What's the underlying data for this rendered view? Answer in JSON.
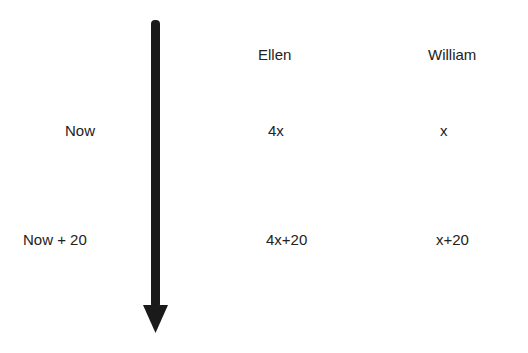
{
  "columns": [
    "Ellen",
    "William"
  ],
  "rows": [
    {
      "label": "Now",
      "ellen": "4x",
      "william": "x"
    },
    {
      "label": "Now + 20",
      "ellen": "4x+20",
      "william": "x+20"
    }
  ],
  "arrow": {
    "direction": "down",
    "meaning": "time",
    "color": "#1a1a1a"
  }
}
